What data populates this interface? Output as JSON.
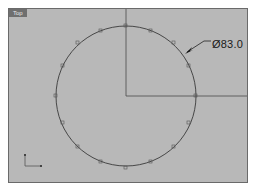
{
  "viewport": {
    "label": "Top",
    "background": "#b8b8b8"
  },
  "dimension": {
    "type": "diameter",
    "text": "Ø83.0"
  },
  "geometry": {
    "circle": {
      "cx": 117,
      "cy": 87,
      "r": 70,
      "control_points": 16
    },
    "axes_lines": {
      "origin": [
        117,
        87
      ]
    }
  },
  "icons": {
    "cplane_axes": "xy-axes-icon"
  }
}
